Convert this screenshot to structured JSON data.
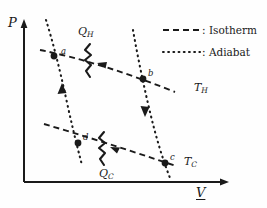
{
  "figure": {
    "background_color": "#fefefe",
    "ink_color": "#1a1a1a"
  },
  "axes": {
    "y_label": "P",
    "x_label": "V",
    "x_label_underlined": true,
    "origin": {
      "x": 24,
      "y": 182
    },
    "y_axis_top": {
      "x": 24,
      "y": 22
    },
    "x_axis_right": {
      "x": 228,
      "y": 182
    }
  },
  "legend": {
    "entries": [
      {
        "sample": "dashed",
        "separator": ":",
        "label": "Isotherm"
      },
      {
        "sample": "dotted",
        "separator": ":",
        "label": "Adiabat"
      }
    ]
  },
  "points": [
    {
      "id": "a",
      "label": "a",
      "x": 54,
      "y": 56,
      "label_dx": 7,
      "label_dy": -9
    },
    {
      "id": "b",
      "label": "b",
      "x": 143,
      "y": 79,
      "label_dx": 5,
      "label_dy": -10
    },
    {
      "id": "c",
      "label": "c",
      "x": 165,
      "y": 163,
      "label_dx": 5,
      "label_dy": -10
    },
    {
      "id": "d",
      "label": "d",
      "x": 78,
      "y": 143,
      "label_dx": 5,
      "label_dy": -10
    }
  ],
  "curves": {
    "isotherm_hot": {
      "name": "T_H",
      "style": "dashed",
      "label": "T",
      "label_sub": "H",
      "label_x": 196,
      "label_y": 88
    },
    "isotherm_cold": {
      "name": "T_C",
      "style": "dashed",
      "label": "T",
      "label_sub": "C",
      "label_x": 185,
      "label_y": 163
    },
    "adiabat_left": {
      "name": "d-to-a",
      "style": "dotted",
      "arrow": "up"
    },
    "adiabat_right": {
      "name": "b-to-c",
      "style": "dotted",
      "arrow": "down"
    }
  },
  "heat_flows": [
    {
      "id": "QH",
      "label": "Q",
      "label_sub": "H",
      "label_x": 80,
      "label_y": 30
    },
    {
      "id": "QC",
      "label": "Q",
      "label_sub": "C",
      "label_x": 100,
      "label_y": 172
    }
  ]
}
